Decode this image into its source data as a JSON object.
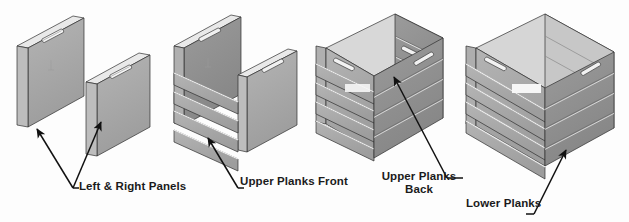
{
  "diagram": {
    "background_color": "#fdfdfd",
    "line_color": "#111111",
    "face_color": "#a8a8a8",
    "face_dark_color": "#8f8f8f",
    "face_light_color": "#c2c2c2",
    "edge_highlight_color": "#efefef",
    "text_color": "#1b1b1b"
  },
  "labels": {
    "left_right_panels": "Left & Right Panels",
    "upper_planks_front": "Upper Planks Front",
    "upper_planks_back": "Upper Planks Back",
    "lower_planks": "Lower Planks"
  },
  "steps": [
    {
      "index": 1,
      "name": "left-and-right-panels",
      "label": "Left & Right Panels",
      "parts": [
        "left panel",
        "right panel"
      ],
      "handle_slots": 2,
      "description": "Two separate flat side panels shown in isometric view, each with a pill-shaped handle slot near the top."
    },
    {
      "index": 2,
      "name": "upper-planks-front",
      "label": "Upper Planks Front",
      "plank_count": 4,
      "description": "Side panels joined with four horizontal front planks attached across the front face."
    },
    {
      "index": 3,
      "name": "upper-planks-back",
      "label": "Upper Planks Back",
      "plank_count": 4,
      "description": "Back planks added, forming an open-top box; the interior back face is visible."
    },
    {
      "index": 4,
      "name": "lower-planks",
      "label": "Lower Planks",
      "plank_count": 4,
      "description": "Completed crate with lower planks fitted, open top."
    }
  ]
}
